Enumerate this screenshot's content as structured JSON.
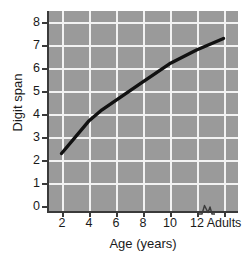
{
  "chart_data": {
    "type": "line",
    "title": "",
    "subtitle": "",
    "xlabel": "Age (years)",
    "ylabel": "Digit span",
    "grid": true,
    "legend": null,
    "ylim": [
      0,
      8.5
    ],
    "yticks": [
      0,
      1,
      2,
      3,
      4,
      5,
      6,
      7,
      8
    ],
    "ytick_labels": [
      "0",
      "1",
      "2",
      "3",
      "4",
      "5",
      "6",
      "7",
      "8"
    ],
    "xtick_labels": [
      "2",
      "4",
      "6",
      "8",
      "10",
      "12",
      "Adults"
    ],
    "x_axis_break": true,
    "x_axis_break_between": [
      "12",
      "Adults"
    ],
    "categories": [
      2,
      4,
      5,
      6,
      8,
      10,
      12,
      "Adults"
    ],
    "series": [
      {
        "name": "Digit span",
        "color": "#111111",
        "values": [
          2.5,
          3.9,
          4.4,
          4.8,
          5.6,
          6.4,
          7.0,
          7.5
        ]
      }
    ],
    "points": [
      {
        "x_label": "2",
        "x": 2,
        "y": 2.5
      },
      {
        "x_label": "4",
        "x": 4,
        "y": 3.9
      },
      {
        "x_label": "5",
        "x": 5,
        "y": 4.4
      },
      {
        "x_label": "6",
        "x": 6,
        "y": 4.8
      },
      {
        "x_label": "8",
        "x": 8,
        "y": 5.6
      },
      {
        "x_label": "10",
        "x": 10,
        "y": 6.4
      },
      {
        "x_label": "12",
        "x": 12,
        "y": 7.0
      },
      {
        "x_label": "Adults",
        "x": 14,
        "y": 7.5
      }
    ],
    "colors": {
      "plot_background": "#9a9a9a",
      "gridline": "#f2f2f2",
      "axis": "#3a3a3a",
      "line": "#111111",
      "text": "#1a1a1a",
      "figure_background": "#ffffff"
    }
  },
  "axis": {
    "y_title": "Digit span",
    "x_title": "Age (years)",
    "y_ticks": [
      {
        "label": "8"
      },
      {
        "label": "7"
      },
      {
        "label": "6"
      },
      {
        "label": "5"
      },
      {
        "label": "4"
      },
      {
        "label": "3"
      },
      {
        "label": "2"
      },
      {
        "label": "1"
      },
      {
        "label": "0"
      }
    ],
    "x_ticks": [
      {
        "label": "2"
      },
      {
        "label": "4"
      },
      {
        "label": "6"
      },
      {
        "label": "8"
      },
      {
        "label": "10"
      },
      {
        "label": "12"
      },
      {
        "label": "Adults"
      }
    ]
  }
}
